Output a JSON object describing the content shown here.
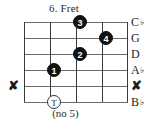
{
  "diagram": {
    "title": "6. Fret",
    "caption": "(no 5)",
    "colors": {
      "string_line": "#6d6d6d",
      "fret_line": "#3a3a3a",
      "dot_fill": "#111111",
      "dot_text": "#ffffff",
      "text": "#1d1d1d",
      "background": "#ffffff"
    },
    "grid": {
      "strings": 6,
      "frets": 4,
      "string_ys": [
        0,
        16,
        32,
        48,
        64,
        80
      ],
      "fret_xs": [
        0,
        26,
        52,
        78,
        104
      ]
    },
    "string_labels": [
      {
        "name": "C",
        "accidental": "♭",
        "mute": false
      },
      {
        "name": "G",
        "accidental": "",
        "mute": false
      },
      {
        "name": "D",
        "accidental": "",
        "mute": false
      },
      {
        "name": "A",
        "accidental": "♭",
        "mute": false
      },
      {
        "name": "✘",
        "accidental": "",
        "mute": true
      },
      {
        "name": "B",
        "accidental": "♭",
        "mute": false
      }
    ],
    "mute_marker": {
      "glyph": "✘",
      "string_index": 4
    },
    "fingerings": [
      {
        "label": "3",
        "type": "filled",
        "string_index": 0,
        "fret": 3,
        "x": 56,
        "y": 0
      },
      {
        "label": "4",
        "type": "filled",
        "string_index": 1,
        "fret": 4,
        "x": 82,
        "y": 16
      },
      {
        "label": "2",
        "type": "filled",
        "string_index": 2,
        "fret": 3,
        "x": 56,
        "y": 32
      },
      {
        "label": "1",
        "type": "filled",
        "string_index": 3,
        "fret": 2,
        "x": 30,
        "y": 48
      },
      {
        "label": "T",
        "type": "open",
        "string_index": 5,
        "fret": 2,
        "x": 30,
        "y": 80
      }
    ]
  }
}
